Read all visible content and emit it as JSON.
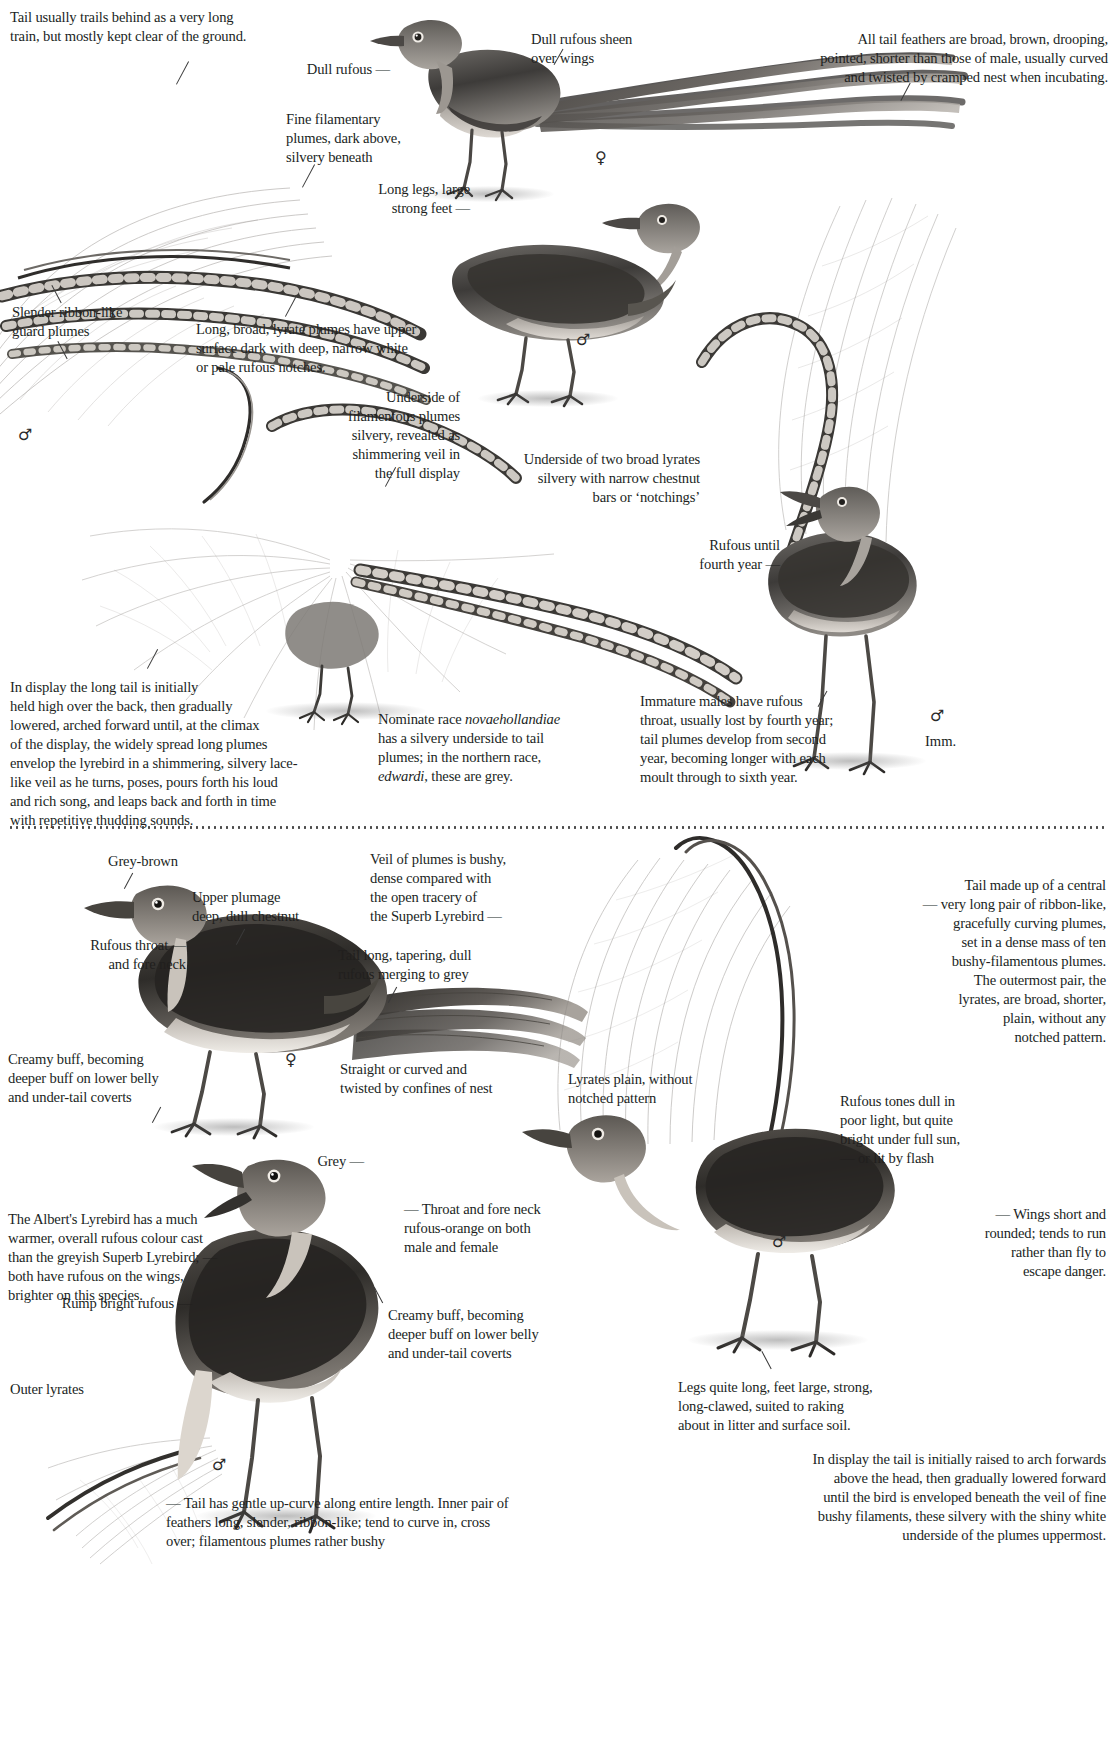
{
  "page": {
    "ink": "#211f1e",
    "background": "#ffffff"
  },
  "top_plate": {
    "species": "Superb Lyrebird",
    "annotations": [
      {
        "id": "tail-train",
        "text": "Tail usually trails behind as a very long\ntrain, but mostly kept clear of the ground."
      },
      {
        "id": "dull-rufous",
        "text": "Dull rufous  —"
      },
      {
        "id": "filamentary",
        "text": "Fine filamentary\nplumes, dark above,\nsilvery beneath"
      },
      {
        "id": "long-legs",
        "text": "Long legs, large\nstrong feet  —"
      },
      {
        "id": "rufous-sheen",
        "text": "Dull rufous sheen\nover wings"
      },
      {
        "id": "female-tail",
        "text": "All tail feathers are broad, brown, drooping,\npointed, shorter than those of male, usually curved\nand twisted by cramped nest when incubating."
      },
      {
        "id": "guard-plumes",
        "text": "Slender ribbon-like\nguard plumes"
      },
      {
        "id": "lyrate-plumes",
        "text": "Long, broad, lyrate plumes have upper\nsurface dark with deep, narrow white\nor pale rufous notches."
      },
      {
        "id": "underside-plumes",
        "text": "Underside of\nfilamentous plumes\nsilvery, revealed as\nshimmering veil in\nthe full display"
      },
      {
        "id": "underside-lyrates",
        "text": "Underside of two broad lyrates\nsilvery with narrow chestnut\nbars or ‘notchings’"
      },
      {
        "id": "rufous-fourth",
        "text": "Rufous until\nfourth year  —"
      },
      {
        "id": "display-desc",
        "text": "In display the long tail is initially\nheld high over the back, then gradually\nlowered, arched forward until, at the climax\nof the display, the widely spread long plumes\nenvelop the lyrebird in a shimmering, silvery lace-\nlike veil as he turns, poses, pours forth his loud\nand rich song, and leaps back and forth in time\nwith repetitive thudding sounds."
      },
      {
        "id": "immature-males",
        "text": "Immature males have rufous\nthroat, usually lost by fourth year;\ntail plumes develop from second\nyear, becoming longer with each\nmoult through to sixth year."
      }
    ],
    "race_note": {
      "line1": "Nominate race ",
      "italic1": "novaehollandiae",
      "line2": "has a silvery underside to tail",
      "line3": "plumes; in the northern race,",
      "italic2": "edwardi",
      "line4": ", these are grey."
    },
    "symbols": {
      "female": "♀",
      "male": "♂",
      "male2": "♂",
      "male3": "♂",
      "immature": "Imm."
    }
  },
  "bottom_plate": {
    "species": "Albert's Lyrebird",
    "annotations": [
      {
        "id": "grey-brown",
        "text": "Grey-brown"
      },
      {
        "id": "upper-plumage",
        "text": "Upper plumage\ndeep, dull chestnut"
      },
      {
        "id": "rufous-throat",
        "text": "Rufous throat  —\nand fore neck"
      },
      {
        "id": "tail-long",
        "text": "Tail long, tapering, dull\nrufous merging to grey"
      },
      {
        "id": "creamy-buff-1",
        "text": "Creamy buff, becoming\ndeeper buff on lower belly\nand under-tail coverts"
      },
      {
        "id": "straight-curved",
        "text": "Straight or curved and\ntwisted by confines of nest"
      },
      {
        "id": "veil-of-plumes",
        "text": "Veil of plumes is bushy,\ndense compared with\nthe open tracery of\nthe Superb Lyrebird  —"
      },
      {
        "id": "lyrates-plain",
        "text": "Lyrates plain, without\nnotched pattern"
      },
      {
        "id": "tail-central",
        "text": "Tail made up of a central\n—  very long pair of ribbon-like,\ngracefully curving plumes,\nset in a dense mass of ten\nbushy-filamentous plumes.\nThe outermost pair, the\nlyrates, are broad,  shorter,\nplain, without any\nnotched pattern."
      },
      {
        "id": "rufous-tones",
        "text": "Rufous tones dull in\npoor light, but quite\nbright under full sun,\n—  or lit by flash"
      },
      {
        "id": "grey",
        "text": "Grey  —"
      },
      {
        "id": "throat-fore-neck",
        "text": "—  Throat and fore neck\nrufous-orange on both\nmale and female"
      },
      {
        "id": "albert-warm",
        "text": "The Albert's Lyrebird has a much\nwarmer, overall rufous colour cast\nthan the greyish Superb Lyrebird;  —\nboth have rufous on the wings,\nbrighter on this species."
      },
      {
        "id": "wings-short",
        "text": "—  Wings short and\nrounded; tends to run\nrather than fly to\nescape danger."
      },
      {
        "id": "creamy-buff-2",
        "text": "Creamy buff, becoming\ndeeper buff on lower belly\nand under-tail coverts"
      },
      {
        "id": "rump-rufous",
        "text": "Rump bright rufous  —"
      },
      {
        "id": "outer-lyrates",
        "text": "Outer lyrates"
      },
      {
        "id": "legs-long",
        "text": "Legs quite long, feet large, strong,\nlong-clawed, suited to raking\nabout in litter and surface soil."
      },
      {
        "id": "display-albert",
        "text": "In display the tail is initially raised to arch forwards\nabove the head, then gradually lowered forward\nuntil the bird is enveloped beneath the veil of fine\nbushy filaments, these silvery with the shiny white\nunderside of the plumes uppermost."
      },
      {
        "id": "tail-upcurve",
        "text": "—  Tail has gentle up-curve along entire length. Inner pair of\nfeathers long, slender, ribbon-like; tend to curve in, cross\nover; filamentous plumes rather bushy"
      }
    ],
    "symbols": {
      "female": "♀",
      "male": "♂",
      "male2": "♂"
    }
  }
}
